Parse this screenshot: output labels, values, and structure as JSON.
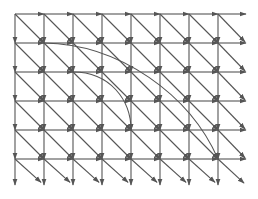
{
  "diagram": {
    "type": "directed-grid-graph",
    "columns": 8,
    "rows": 6,
    "origin": [
      15,
      14
    ],
    "spacing": [
      29,
      29
    ],
    "edge_color": "#555555",
    "background": "#ffffff",
    "edge_kinds": [
      "right",
      "down",
      "diagonal-down-right"
    ],
    "boundary_arrow_length": 28,
    "curved_edges": [
      {
        "from": [
          1,
          1
        ],
        "to": [
          7,
          5
        ],
        "ctrl": [
          [
            120,
            44
          ],
          [
            190,
            95
          ]
        ]
      },
      {
        "from": [
          2,
          2
        ],
        "to": [
          4,
          4
        ],
        "ctrl": [
          [
            110,
            72
          ],
          [
            131,
            100
          ]
        ]
      }
    ]
  }
}
